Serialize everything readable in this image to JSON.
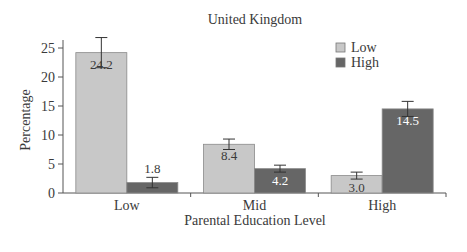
{
  "chart_data": {
    "type": "bar",
    "title": "United Kingdom",
    "xlabel": "Parental Education Level",
    "ylabel": "Percentage",
    "categories": [
      "Low",
      "Mid",
      "High"
    ],
    "series": [
      {
        "name": "Low",
        "color": "#c8c8c8",
        "values": [
          24.2,
          8.4,
          3.0
        ],
        "labels": [
          "24.2",
          "8.4",
          "3.0"
        ],
        "error": [
          2.6,
          0.9,
          0.6
        ]
      },
      {
        "name": "High",
        "color": "#666666",
        "values": [
          1.8,
          4.2,
          14.5
        ],
        "labels": [
          "1.8",
          "4.2",
          "14.5"
        ],
        "error": [
          0.9,
          0.6,
          1.3
        ]
      }
    ],
    "ylim": [
      0,
      25
    ],
    "yticks": [
      0,
      5,
      10,
      15,
      20,
      25
    ],
    "ytick_labels": [
      "0",
      "5",
      "10",
      "15",
      "20",
      "25"
    ],
    "legend": {
      "position": "upper right",
      "entries": [
        "Low",
        "High"
      ]
    },
    "grid": false
  }
}
